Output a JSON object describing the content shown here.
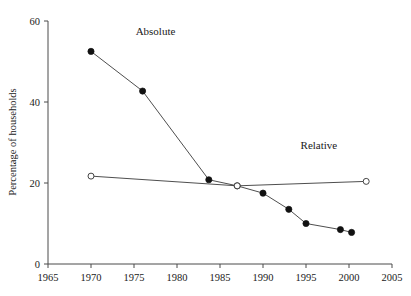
{
  "chart_data": {
    "type": "line",
    "title": "",
    "xlabel": "",
    "ylabel": "Percentage of households",
    "xlim": [
      1965,
      2005
    ],
    "ylim": [
      0,
      60
    ],
    "xticks": [
      1965,
      1970,
      1975,
      1980,
      1985,
      1990,
      1995,
      2000,
      2005
    ],
    "xtick_labels": [
      "1965",
      "1970",
      "1975",
      "1980",
      "1985",
      "1990",
      "1995",
      "2000",
      "2005"
    ],
    "yticks": [
      0,
      20,
      40,
      60
    ],
    "ytick_labels": [
      "0",
      "20",
      "40",
      "60"
    ],
    "grid": false,
    "legend_position": "inline-annotations",
    "series": [
      {
        "name": "Absolute",
        "marker": "filled-circle",
        "label_x": 1977.5,
        "label_y": 56.5,
        "x": [
          1970,
          1976,
          1983.7,
          1987,
          1990,
          1993,
          1995,
          1999,
          2000.3
        ],
        "values": [
          52.5,
          42.7,
          20.8,
          19.3,
          17.5,
          13.5,
          10.0,
          8.5,
          7.8
        ]
      },
      {
        "name": "Relative",
        "marker": "open-circle",
        "label_x": 1996.5,
        "label_y": 28.5,
        "x": [
          1970,
          1987,
          2002
        ],
        "values": [
          21.7,
          19.3,
          20.4
        ]
      }
    ]
  }
}
